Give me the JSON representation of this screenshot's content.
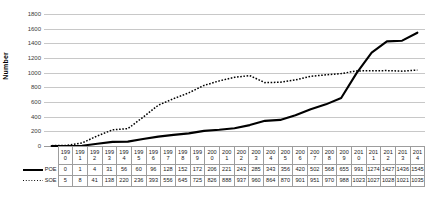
{
  "chart_data": {
    "type": "line",
    "title": "",
    "xlabel": "",
    "ylabel": "Number",
    "ylim": [
      0,
      1800
    ],
    "yticks": [
      1800,
      1600,
      1400,
      1200,
      1000,
      800,
      600,
      400,
      200,
      0
    ],
    "grid": true,
    "legend_position": "table-left",
    "categories": [
      "1990",
      "1991",
      "1992",
      "1993",
      "1994",
      "1995",
      "1996",
      "1997",
      "1998",
      "1999",
      "2000",
      "2001",
      "2002",
      "2003",
      "2004",
      "2005",
      "2006",
      "2007",
      "2008",
      "2009",
      "2010",
      "2011",
      "2012",
      "2013",
      "2014"
    ],
    "series": [
      {
        "name": "POE",
        "style": "solid",
        "color": "#000000",
        "values": [
          0,
          1,
          4,
          31,
          56,
          60,
          96,
          128,
          152,
          172,
          206,
          221,
          243,
          285,
          343,
          356,
          420,
          502,
          568,
          655,
          991,
          1274,
          1427,
          1436,
          1545
        ]
      },
      {
        "name": "SOE",
        "style": "dotted",
        "color": "#000000",
        "values": [
          5,
          8,
          41,
          138,
          220,
          236,
          393,
          556,
          645,
          725,
          826,
          888,
          937,
          960,
          864,
          870,
          901,
          951,
          970,
          988,
          1023,
          1027,
          1028,
          1021,
          1035
        ]
      }
    ]
  },
  "table": {
    "year_label_rows": [
      [
        "199",
        "199",
        "199",
        "199",
        "199",
        "199",
        "199",
        "199",
        "199",
        "199",
        "200",
        "200",
        "200",
        "200",
        "200",
        "200",
        "200",
        "200",
        "200",
        "200",
        "201",
        "201",
        "201",
        "201",
        "201"
      ],
      [
        "0",
        "1",
        "2",
        "3",
        "4",
        "5",
        "6",
        "7",
        "8",
        "9",
        "0",
        "1",
        "2",
        "3",
        "4",
        "5",
        "6",
        "7",
        "8",
        "9",
        "0",
        "1",
        "2",
        "3",
        "4"
      ]
    ]
  },
  "icons": {
    "poe_line_marker": "solid-line-icon",
    "soe_line_marker": "dotted-line-icon"
  }
}
